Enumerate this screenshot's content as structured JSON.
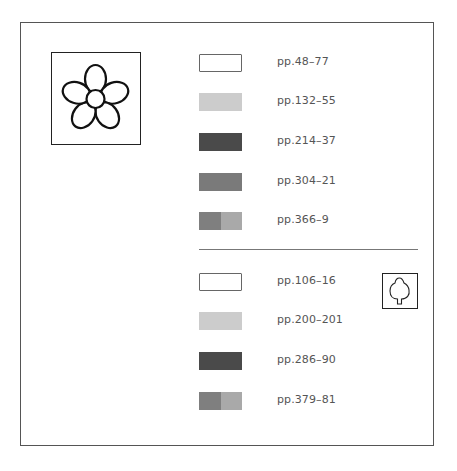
{
  "sections": [
    {
      "icon": "flower-icon",
      "items": [
        {
          "label": "pp.48–77",
          "swatch": {
            "type": "outline",
            "colors": [
              "#ffffff"
            ]
          }
        },
        {
          "label": "pp.132–55",
          "swatch": {
            "type": "solid",
            "colors": [
              "#cccccc"
            ]
          }
        },
        {
          "label": "pp.214–37",
          "swatch": {
            "type": "solid",
            "colors": [
              "#4a4a4a"
            ]
          }
        },
        {
          "label": "pp.304–21",
          "swatch": {
            "type": "solid",
            "colors": [
              "#7a7a7a"
            ]
          }
        },
        {
          "label": "pp.366–9",
          "swatch": {
            "type": "split",
            "colors": [
              "#7f7f7f",
              "#a9a9a9"
            ]
          }
        }
      ]
    },
    {
      "icon": "tree-icon",
      "items": [
        {
          "label": "pp.106–16",
          "swatch": {
            "type": "outline",
            "colors": [
              "#ffffff"
            ]
          }
        },
        {
          "label": "pp.200–201",
          "swatch": {
            "type": "solid",
            "colors": [
              "#cccccc"
            ]
          }
        },
        {
          "label": "pp.286–90",
          "swatch": {
            "type": "solid",
            "colors": [
              "#4a4a4a"
            ]
          }
        },
        {
          "label": "pp.379–81",
          "swatch": {
            "type": "split",
            "colors": [
              "#7f7f7f",
              "#a9a9a9"
            ]
          }
        }
      ]
    }
  ]
}
